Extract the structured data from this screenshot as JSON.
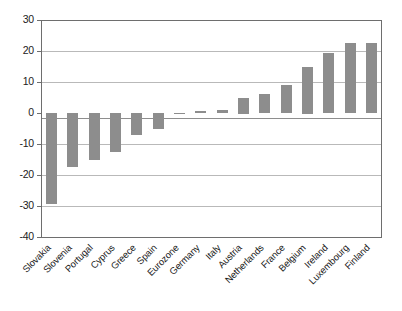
{
  "chart_data": {
    "type": "bar",
    "title": "",
    "subtitle": "",
    "xlabel": "",
    "ylabel": "",
    "ylim": [
      -40,
      30
    ],
    "yticks": [
      30,
      20,
      10,
      0,
      -10,
      -20,
      -30,
      -40
    ],
    "ytick_labels": [
      "30",
      "20",
      "10",
      "0",
      "-10",
      "-20",
      "-30",
      "-40"
    ],
    "grid": true,
    "legend": false,
    "legend_position": "none",
    "bar_color": "#8d8d8d",
    "categories": [
      "Slovakia",
      "Slovenia",
      "Portugal",
      "Cyprus",
      "Greece",
      "Spain",
      "Eurozone",
      "Germany",
      "Italy",
      "Austria",
      "Netherlands",
      "France",
      "Belgium",
      "Ireland",
      "Luxembourg",
      "Finland"
    ],
    "values": [
      -29.5,
      -17.5,
      -15,
      -12.5,
      -7,
      -5,
      -0.3,
      0.5,
      1,
      5,
      6,
      9,
      15,
      19.5,
      22.5,
      22.5
    ]
  }
}
